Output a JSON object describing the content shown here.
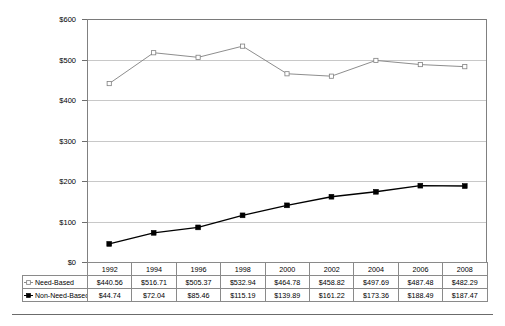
{
  "chart_data": {
    "type": "line",
    "title": "",
    "subtitle": "",
    "xlabel": "",
    "ylabel": "",
    "categories": [
      "1992",
      "1994",
      "1996",
      "1998",
      "2000",
      "2002",
      "2004",
      "2006",
      "2008"
    ],
    "series": [
      {
        "name": "Need-Based",
        "marker": "open-triangle",
        "color": "#808080",
        "values": [
          440.56,
          516.71,
          505.37,
          532.94,
          464.78,
          458.82,
          497.69,
          487.48,
          482.29
        ],
        "labels": [
          "$440.56",
          "$516.71",
          "$505.37",
          "$532.94",
          "$464.78",
          "$458.82",
          "$497.69",
          "$487.48",
          "$482.29"
        ]
      },
      {
        "name": "Non-Need-Based",
        "marker": "filled-square",
        "color": "#000000",
        "values": [
          44.74,
          72.04,
          85.46,
          115.19,
          139.89,
          161.22,
          173.36,
          188.49,
          187.47
        ],
        "labels": [
          "$44.74",
          "$72.04",
          "$85.46",
          "$115.19",
          "$139.89",
          "$161.22",
          "$173.36",
          "$188.49",
          "$187.47"
        ]
      }
    ],
    "ylim": [
      0,
      600
    ],
    "yticks": [
      0,
      100,
      200,
      300,
      400,
      500,
      600
    ],
    "ytick_labels": [
      "$0",
      "$100",
      "$200",
      "$300",
      "$400",
      "$500",
      "$600"
    ],
    "grid": true,
    "legend_position": "data-table-row-headers",
    "has_data_table": true
  },
  "axis": {
    "y_labels": [
      "$600",
      "$500",
      "$400",
      "$300",
      "$200",
      "$100",
      "$0"
    ]
  },
  "table": {
    "column_headers": [
      "1992",
      "1994",
      "1996",
      "1998",
      "2000",
      "2002",
      "2004",
      "2006",
      "2008"
    ],
    "rows": [
      {
        "label": "Need-Based",
        "marker": "open-triangle-marker-icon",
        "values": [
          "$440.56",
          "$516.71",
          "$505.37",
          "$532.94",
          "$464.78",
          "$458.82",
          "$497.69",
          "$487.48",
          "$482.29"
        ]
      },
      {
        "label": "Non-Need-Based",
        "marker": "filled-square-marker-icon",
        "values": [
          "$44.74",
          "$72.04",
          "$85.46",
          "$115.19",
          "$139.89",
          "$161.22",
          "$173.36",
          "$188.49",
          "$187.47"
        ]
      }
    ]
  },
  "colors": {
    "need_based_line": "#808080",
    "non_need_based_line": "#1a1a1a",
    "gridline": "#c8c8c8",
    "border": "#8a8a8a",
    "background": "#ffffff"
  }
}
